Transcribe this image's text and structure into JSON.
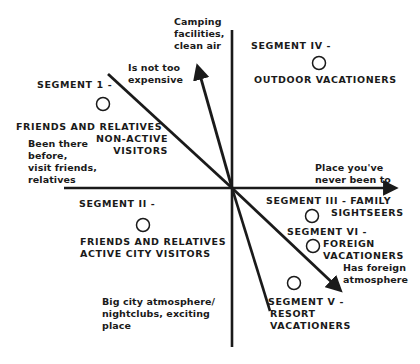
{
  "colors": {
    "ink": "#1a1a1a",
    "background": "#ffffff"
  },
  "axes": {
    "center": [
      232,
      188
    ],
    "vertical": {
      "from": [
        232,
        30
      ],
      "to": [
        232,
        347
      ]
    },
    "horizontal": {
      "from": [
        64,
        188
      ],
      "to": [
        398,
        188
      ],
      "arrow_end": "right"
    }
  },
  "vectors": [
    {
      "id": "not-too-expensive",
      "label": "Is not too\nexpensive",
      "from": [
        232,
        188
      ],
      "to": [
        108,
        74
      ],
      "arrow": false
    },
    {
      "id": "camping-clean-air",
      "label": "Camping\nfacilities,\nclean air",
      "from": [
        232,
        188
      ],
      "to": [
        196,
        64
      ],
      "arrow": true
    },
    {
      "id": "place-never-been",
      "label": "Place you've\nnever been to",
      "from": [
        64,
        188
      ],
      "to": [
        398,
        188
      ],
      "arrow": true
    },
    {
      "id": "foreign-atmosphere",
      "label": "Has foreign\natmosphere",
      "from": [
        232,
        188
      ],
      "to": [
        342,
        292
      ],
      "arrow": true
    },
    {
      "id": "big-city",
      "label": "Big city atmosphere/\nnightclubs, exciting\nplace",
      "from": [
        232,
        188
      ],
      "to": [
        270,
        311
      ],
      "arrow": false
    },
    {
      "id": "been-there",
      "label": "Been there\nbefore,\nvisit friends,\nrelatives",
      "from": [
        232,
        188
      ],
      "to": [
        64,
        188
      ],
      "arrow": false
    }
  ],
  "segments": [
    {
      "id": "segment-1",
      "title": "SEGMENT 1 -",
      "name": "FRIENDS AND RELATIVES\nNON-ACTIVE\nVISITORS",
      "point": [
        103,
        104
      ]
    },
    {
      "id": "segment-2",
      "title": "SEGMENT II -",
      "name": "FRIENDS AND RELATIVES\nACTIVE CITY VISITORS",
      "point": [
        143,
        225
      ]
    },
    {
      "id": "segment-3",
      "title": "SEGMENT III - FAMILY",
      "name": "SIGHTSEERS",
      "point": [
        312,
        216
      ]
    },
    {
      "id": "segment-4",
      "title": "SEGMENT IV -",
      "name": "OUTDOOR VACATIONERS",
      "point": [
        319,
        63
      ]
    },
    {
      "id": "segment-5",
      "title": "SEGMENT V -",
      "name": "RESORT\nVACATIONERS",
      "point": [
        294,
        283
      ]
    },
    {
      "id": "segment-6",
      "title": "SEGMENT VI -",
      "name": "FOREIGN\nVACATIONERS",
      "point": [
        313,
        246
      ]
    }
  ],
  "labels": {
    "camping": "Camping\nfacilities,\nclean air",
    "not_expensive": "Is not too\nexpensive",
    "place_never": "Place you've\nnever been to",
    "been_there": "Been there\nbefore,\nvisit friends,\nrelatives",
    "foreign": "Has foreign\natmosphere",
    "big_city": "Big city atmosphere/\nnightclubs, exciting\nplace",
    "seg1_title": "SEGMENT 1 -",
    "seg1_name_a": "FRIENDS AND RELATIVES",
    "seg1_name_b": "NON-ACTIVE\nVISITORS",
    "seg2_title": "SEGMENT II -",
    "seg2_name": "FRIENDS AND RELATIVES\nACTIVE CITY VISITORS",
    "seg3_title": "SEGMENT III - FAMILY",
    "seg3_name": "SIGHTSEERS",
    "seg4_title": "SEGMENT IV -",
    "seg4_name": "OUTDOOR VACATIONERS",
    "seg5_title": "SEGMENT V -",
    "seg5_name": "RESORT\nVACATIONERS",
    "seg6_title": "SEGMENT VI -",
    "seg6_name": "FOREIGN\nVACATIONERS"
  }
}
